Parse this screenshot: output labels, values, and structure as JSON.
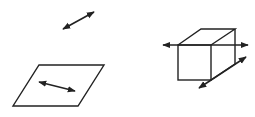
{
  "diagram": {
    "colors": {
      "background": "#ffffff",
      "stroke": "#222222"
    },
    "figures": [
      {
        "id": "free-arrow",
        "type": "double-arrow",
        "from": [
          63,
          29
        ],
        "to": [
          94,
          12
        ]
      },
      {
        "id": "plane",
        "type": "parallelogram",
        "points": [
          [
            39,
            65
          ],
          [
            104,
            65
          ],
          [
            78,
            106
          ],
          [
            13,
            106
          ]
        ],
        "arrow": {
          "type": "double-arrow",
          "from": [
            39,
            82
          ],
          "to": [
            75,
            91
          ]
        }
      },
      {
        "id": "cube",
        "type": "cube",
        "front_face": [
          [
            178,
            45
          ],
          [
            211,
            45
          ],
          [
            211,
            80
          ],
          [
            178,
            80
          ]
        ],
        "back_top": [
          [
            201,
            29
          ],
          [
            235,
            29
          ]
        ],
        "back_right_bottom": [
          235,
          64
        ],
        "arrows": [
          {
            "type": "double-arrow",
            "from": [
              163,
              45
            ],
            "to": [
              248,
              45
            ]
          },
          {
            "type": "double-arrow",
            "from": [
              199,
              88
            ],
            "to": [
              246,
              57
            ]
          }
        ]
      }
    ]
  }
}
